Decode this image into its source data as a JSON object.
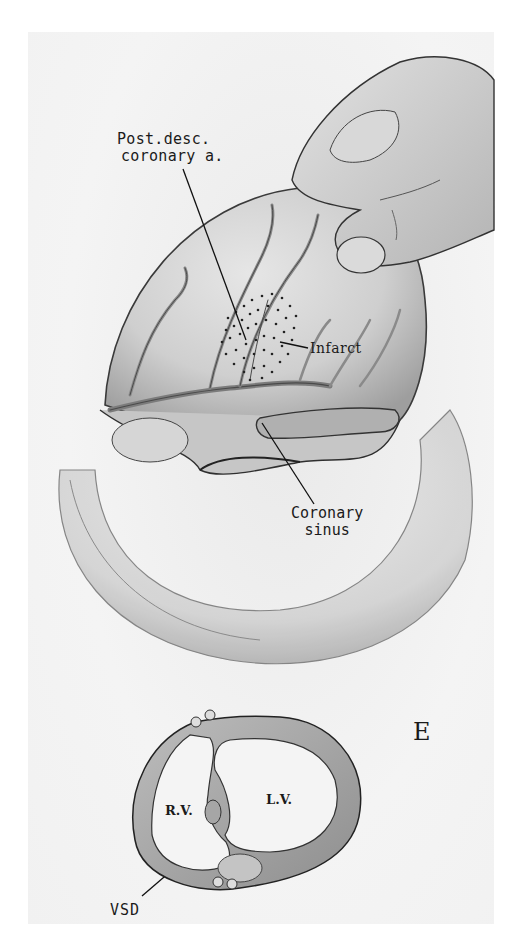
{
  "figure": {
    "panel_letter": "E",
    "labels": {
      "post_desc_line1": "Post.desc.",
      "post_desc_line2": "coronary a.",
      "infarct": "Infarct",
      "coronary_sinus_line1": "Coronary",
      "coronary_sinus_line2": "sinus",
      "rv": "R.V.",
      "lv": "L.V.",
      "vsd": "VSD"
    },
    "colors": {
      "background": "#ffffff",
      "plate": "#f3f3f3",
      "pencil": "#2a2a2a",
      "shade": "#9a9a9a"
    }
  }
}
